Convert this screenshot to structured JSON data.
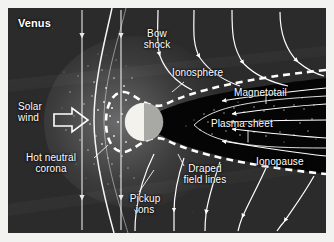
{
  "figure": {
    "background_color": "#2b2b2b",
    "planet_day_color": "#f4f2ec",
    "planet_night_color": "#a8a8a4",
    "line_color": "#ffffff",
    "magnetotail_color": "#050505"
  },
  "labels": {
    "planet": "Venus",
    "solar_wind": "Solar\nwind",
    "hot_neutral_corona": "Hot neutral\ncorona",
    "bow_shock": "Bow\nshock",
    "pickup_ions": "Pickup\nions",
    "ionosphere": "Ionosphere",
    "magnetotail": "Magnetotail",
    "plasma_sheet": "Plasma sheet",
    "ionopause": "Ionopause",
    "draped_field_lines": "Draped\nfield lines"
  },
  "features": [
    {
      "name": "venus-planet",
      "kind": "disk",
      "description": "Venus disk, lit left hemisphere, shadowed right hemisphere"
    },
    {
      "name": "bow-shock",
      "kind": "curve",
      "description": "Curved shock front upstream of the planet"
    },
    {
      "name": "ionopause",
      "kind": "dashed-curve",
      "description": "Dashed boundary enclosing ionosphere and magnetotail"
    },
    {
      "name": "magnetotail",
      "kind": "wedge",
      "description": "Dark wedge extending downstream to the right edge"
    },
    {
      "name": "plasma-sheet",
      "kind": "speckled-band",
      "description": "Speckled band along the magnetotail centre"
    },
    {
      "name": "hot-neutral-corona",
      "kind": "stipple",
      "description": "Dotted neutral corona around the planet"
    },
    {
      "name": "imf-lines",
      "kind": "straight-arrow-lines",
      "description": "Vertical interplanetary magnetic field lines with downward arrows"
    },
    {
      "name": "draped-field-lines",
      "kind": "curved-arrow-lines",
      "description": "Field lines draped around the obstacle, arrows pointing downstream"
    },
    {
      "name": "tail-flow-arrows",
      "kind": "arrow-lines",
      "description": "Horizontal arrows inside the magnetotail pointing sunward"
    },
    {
      "name": "solar-wind-arrow",
      "kind": "block-arrow",
      "description": "Outlined block arrow marking solar wind inflow direction"
    }
  ]
}
